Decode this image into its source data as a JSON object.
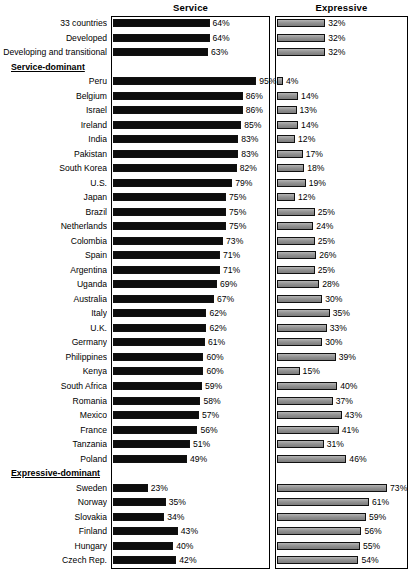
{
  "chart_data": {
    "type": "bar",
    "title": "",
    "orientation": "horizontal",
    "grid": false,
    "legend_position": "top",
    "panels": [
      {
        "name": "service",
        "label": "Service",
        "xlim": [
          0,
          100
        ],
        "color": "#0d0d0d"
      },
      {
        "name": "expressive",
        "label": "Expressive",
        "xlim": [
          0,
          100
        ],
        "color": "#8a8a8a"
      }
    ],
    "xlabel": "",
    "ylabel": "",
    "unit": "%",
    "categories": [
      "33 countries",
      "Developed",
      "Developing and transitional",
      "Peru",
      "Belgium",
      "Israel",
      "Ireland",
      "India",
      "Pakistan",
      "South Korea",
      "U.S.",
      "Japan",
      "Brazil",
      "Netherlands",
      "Colombia",
      "Spain",
      "Argentina",
      "Uganda",
      "Australia",
      "Italy",
      "U.K.",
      "Germany",
      "Philippines",
      "Kenya",
      "South Africa",
      "Romania",
      "Mexico",
      "France",
      "Tanzania",
      "Poland",
      "Sweden",
      "Norway",
      "Slovakia",
      "Finland",
      "Hungary",
      "Czech Rep."
    ],
    "series": [
      {
        "name": "Service",
        "values": [
          64,
          64,
          63,
          95,
          86,
          86,
          85,
          83,
          83,
          82,
          79,
          75,
          75,
          75,
          73,
          71,
          71,
          69,
          67,
          62,
          62,
          61,
          60,
          60,
          59,
          58,
          57,
          56,
          51,
          49,
          23,
          35,
          34,
          43,
          40,
          42
        ]
      },
      {
        "name": "Expressive",
        "values": [
          32,
          32,
          32,
          4,
          14,
          13,
          14,
          12,
          17,
          18,
          19,
          12,
          25,
          24,
          25,
          26,
          25,
          28,
          30,
          35,
          33,
          30,
          39,
          15,
          40,
          37,
          43,
          41,
          31,
          46,
          73,
          61,
          59,
          56,
          55,
          54
        ]
      }
    ],
    "group_headers": [
      {
        "label": "Service-dominant",
        "after_category": "Developing and transitional"
      },
      {
        "label": "Expressive-dominant",
        "after_category": "Poland"
      }
    ]
  },
  "headers": {
    "service": "Service",
    "expressive": "Expressive"
  },
  "groups": {
    "service_dominant": "Service-dominant",
    "expressive_dominant": "Expressive-dominant"
  },
  "rows": [
    {
      "label": "33 countries",
      "service": "64%",
      "expressive": "32%",
      "s": 64,
      "e": 32
    },
    {
      "label": "Developed",
      "service": "64%",
      "expressive": "32%",
      "s": 64,
      "e": 32
    },
    {
      "label": "Developing and transitional",
      "service": "63%",
      "expressive": "32%",
      "s": 63,
      "e": 32
    },
    {
      "group": "Service-dominant"
    },
    {
      "label": "Peru",
      "service": "95%",
      "expressive": "4%",
      "s": 95,
      "e": 4
    },
    {
      "label": "Belgium",
      "service": "86%",
      "expressive": "14%",
      "s": 86,
      "e": 14
    },
    {
      "label": "Israel",
      "service": "86%",
      "expressive": "13%",
      "s": 86,
      "e": 13
    },
    {
      "label": "Ireland",
      "service": "85%",
      "expressive": "14%",
      "s": 85,
      "e": 14
    },
    {
      "label": "India",
      "service": "83%",
      "expressive": "12%",
      "s": 83,
      "e": 12
    },
    {
      "label": "Pakistan",
      "service": "83%",
      "expressive": "17%",
      "s": 83,
      "e": 17
    },
    {
      "label": "South Korea",
      "service": "82%",
      "expressive": "18%",
      "s": 82,
      "e": 18
    },
    {
      "label": "U.S.",
      "service": "79%",
      "expressive": "19%",
      "s": 79,
      "e": 19
    },
    {
      "label": "Japan",
      "service": "75%",
      "expressive": "12%",
      "s": 75,
      "e": 12
    },
    {
      "label": "Brazil",
      "service": "75%",
      "expressive": "25%",
      "s": 75,
      "e": 25
    },
    {
      "label": "Netherlands",
      "service": "75%",
      "expressive": "24%",
      "s": 75,
      "e": 24
    },
    {
      "label": "Colombia",
      "service": "73%",
      "expressive": "25%",
      "s": 73,
      "e": 25
    },
    {
      "label": "Spain",
      "service": "71%",
      "expressive": "26%",
      "s": 71,
      "e": 26
    },
    {
      "label": "Argentina",
      "service": "71%",
      "expressive": "25%",
      "s": 71,
      "e": 25
    },
    {
      "label": "Uganda",
      "service": "69%",
      "expressive": "28%",
      "s": 69,
      "e": 28
    },
    {
      "label": "Australia",
      "service": "67%",
      "expressive": "30%",
      "s": 67,
      "e": 30
    },
    {
      "label": "Italy",
      "service": "62%",
      "expressive": "35%",
      "s": 62,
      "e": 35
    },
    {
      "label": "U.K.",
      "service": "62%",
      "expressive": "33%",
      "s": 62,
      "e": 33
    },
    {
      "label": "Germany",
      "service": "61%",
      "expressive": "30%",
      "s": 61,
      "e": 30
    },
    {
      "label": "Philippines",
      "service": "60%",
      "expressive": "39%",
      "s": 60,
      "e": 39
    },
    {
      "label": "Kenya",
      "service": "60%",
      "expressive": "15%",
      "s": 60,
      "e": 15
    },
    {
      "label": "South Africa",
      "service": "59%",
      "expressive": "40%",
      "s": 59,
      "e": 40
    },
    {
      "label": "Romania",
      "service": "58%",
      "expressive": "37%",
      "s": 58,
      "e": 37
    },
    {
      "label": "Mexico",
      "service": "57%",
      "expressive": "43%",
      "s": 57,
      "e": 43
    },
    {
      "label": "France",
      "service": "56%",
      "expressive": "41%",
      "s": 56,
      "e": 41
    },
    {
      "label": "Tanzania",
      "service": "51%",
      "expressive": "31%",
      "s": 51,
      "e": 31
    },
    {
      "label": "Poland",
      "service": "49%",
      "expressive": "46%",
      "s": 49,
      "e": 46
    },
    {
      "group": "Expressive-dominant"
    },
    {
      "label": "Sweden",
      "service": "23%",
      "expressive": "73%",
      "s": 23,
      "e": 73
    },
    {
      "label": "Norway",
      "service": "35%",
      "expressive": "61%",
      "s": 35,
      "e": 61
    },
    {
      "label": "Slovakia",
      "service": "34%",
      "expressive": "59%",
      "s": 34,
      "e": 59
    },
    {
      "label": "Finland",
      "service": "43%",
      "expressive": "56%",
      "s": 43,
      "e": 56
    },
    {
      "label": "Hungary",
      "service": "40%",
      "expressive": "55%",
      "s": 40,
      "e": 55
    },
    {
      "label": "Czech Rep.",
      "service": "42%",
      "expressive": "54%",
      "s": 42,
      "e": 54
    }
  ]
}
